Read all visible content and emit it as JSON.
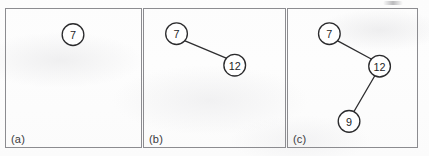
{
  "figure": {
    "caption_style": "panel-letters",
    "background_color": "#fdfdfd",
    "border_color": "#8c8c90",
    "node_fill": "#ffffff",
    "node_stroke": "#2b2b2d",
    "edge_color": "#2e2e30",
    "text_color": "#252527"
  },
  "panels": [
    {
      "label": "(a)",
      "name": "panel-a",
      "nodes": [
        {
          "id": "a7",
          "label": "7",
          "cx": 68,
          "cy": 26,
          "r": 11
        }
      ],
      "edges": []
    },
    {
      "label": "(b)",
      "name": "panel-b",
      "nodes": [
        {
          "id": "b7",
          "label": "7",
          "cx": 33,
          "cy": 25,
          "r": 11
        },
        {
          "id": "b12",
          "label": "12",
          "cx": 92,
          "cy": 57,
          "r": 11
        }
      ],
      "edges": [
        {
          "from": "b7",
          "to": "b12"
        }
      ]
    },
    {
      "label": "(c)",
      "name": "panel-c",
      "nodes": [
        {
          "id": "c7",
          "label": "7",
          "cx": 42,
          "cy": 25,
          "r": 11
        },
        {
          "id": "c12",
          "label": "12",
          "cx": 93,
          "cy": 58,
          "r": 11
        },
        {
          "id": "c9",
          "label": "9",
          "cx": 62,
          "cy": 114,
          "r": 11
        }
      ],
      "edges": [
        {
          "from": "c7",
          "to": "c12"
        },
        {
          "from": "c12",
          "to": "c9"
        }
      ]
    }
  ],
  "panel_geometry": [
    {
      "left": 5,
      "width": 137
    },
    {
      "left": 143,
      "width": 143
    },
    {
      "left": 287,
      "width": 131
    }
  ]
}
